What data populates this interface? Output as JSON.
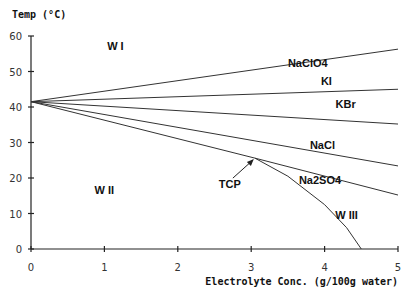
{
  "chart_data": {
    "type": "line",
    "title": "",
    "ylabel": "Temp (°C)",
    "xlabel": "Electrolyte Conc. (g/100g water)",
    "xlim": [
      0,
      5
    ],
    "ylim": [
      0,
      60
    ],
    "x_ticks": [
      0,
      1,
      2,
      3,
      4,
      5
    ],
    "y_ticks": [
      0,
      10,
      20,
      30,
      40,
      50,
      60
    ],
    "grid": false,
    "series": [
      {
        "name": "NaClO4",
        "x": [
          0,
          5
        ],
        "y": [
          41.5,
          56.3
        ]
      },
      {
        "name": "KI",
        "x": [
          0,
          5
        ],
        "y": [
          41.5,
          45.0
        ]
      },
      {
        "name": "KBr",
        "x": [
          0,
          5
        ],
        "y": [
          41.5,
          35.2
        ]
      },
      {
        "name": "NaCl",
        "x": [
          0,
          5
        ],
        "y": [
          41.5,
          23.4
        ]
      },
      {
        "name": "Na2SO4",
        "x": [
          0,
          3.05,
          5
        ],
        "y": [
          41.5,
          25.6,
          15.2
        ]
      },
      {
        "name": "W I/W III boundary",
        "x": [
          3.05,
          3.5,
          4.0,
          4.3,
          4.5
        ],
        "y": [
          25.6,
          20.5,
          12.5,
          6.0,
          0
        ]
      }
    ],
    "annotations": [
      {
        "text": "TCP",
        "x": 3.05,
        "y": 25.6,
        "arrow": true
      }
    ],
    "regions": [
      {
        "label": "W I",
        "x": 1.15,
        "y": 56
      },
      {
        "label": "W II",
        "x": 1.0,
        "y": 15.5
      },
      {
        "label": "W III",
        "x": 4.3,
        "y": 8.5
      }
    ],
    "series_labels": [
      {
        "text": "NaClO4",
        "x": 3.5,
        "y": 51.3
      },
      {
        "text": "KI",
        "x": 3.95,
        "y": 46.2
      },
      {
        "text": "KBr",
        "x": 4.15,
        "y": 39.7
      },
      {
        "text": "NaCl",
        "x": 3.8,
        "y": 28.2
      },
      {
        "text": "Na2SO4",
        "x": 3.65,
        "y": 18.2
      }
    ]
  }
}
